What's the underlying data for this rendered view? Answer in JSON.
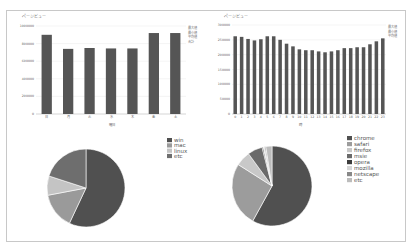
{
  "chart_data": [
    {
      "id": "weekday",
      "type": "bar",
      "title": "ページビュー",
      "xlabel": "曜日",
      "ylabel": "",
      "categories": [
        "日",
        "月",
        "火",
        "水",
        "木",
        "金",
        "土"
      ],
      "values": [
        900000,
        740000,
        750000,
        745000,
        745000,
        920000,
        920000
      ],
      "ylim": [
        0,
        1000000
      ],
      "yticks": [
        "0",
        "200000",
        "400000",
        "600000",
        "800000",
        "1000000"
      ],
      "ytick_values": [
        0,
        200000,
        400000,
        600000,
        800000,
        1000000
      ],
      "grid": true,
      "legend_lines": [
        "最大値",
        "最小値",
        "平均値",
        "合計"
      ],
      "legend_position": "right",
      "bar_color": "#555555"
    },
    {
      "id": "hourly",
      "type": "bar",
      "title": "ページビュー",
      "xlabel": "時",
      "ylabel": "",
      "categories": [
        "0",
        "1",
        "2",
        "3",
        "4",
        "5",
        "6",
        "7",
        "8",
        "9",
        "10",
        "11",
        "12",
        "13",
        "14",
        "15",
        "16",
        "17",
        "18",
        "19",
        "20",
        "21",
        "22",
        "23"
      ],
      "values": [
        262000,
        260000,
        253000,
        248000,
        252000,
        262000,
        262000,
        250000,
        237000,
        228000,
        218000,
        215000,
        215000,
        211000,
        208000,
        211000,
        215000,
        222000,
        222000,
        225000,
        225000,
        235000,
        245000,
        255000
      ],
      "ylim": [
        0,
        300000
      ],
      "yticks": [
        "0",
        "50000",
        "100000",
        "150000",
        "200000",
        "250000",
        "300000"
      ],
      "ytick_values": [
        0,
        50000,
        100000,
        150000,
        200000,
        250000,
        300000
      ],
      "grid": true,
      "legend_lines": [
        "最大値",
        "最小値",
        "平均値"
      ],
      "legend_position": "right",
      "bar_color": "#555555"
    },
    {
      "id": "os",
      "type": "pie",
      "title": "",
      "labels": [
        "win",
        "mac",
        "linux",
        "etc"
      ],
      "values": [
        57,
        15,
        8,
        20
      ],
      "colors": [
        "#505050",
        "#9a9a9a",
        "#c4c4c4",
        "#6e6e6e"
      ],
      "legend_position": "top-right"
    },
    {
      "id": "browser",
      "type": "pie",
      "title": "",
      "labels": [
        "chrome",
        "safari",
        "firefox",
        "msie",
        "opera",
        "mozilla",
        "netscape",
        "etc"
      ],
      "values": [
        58,
        26,
        6,
        6,
        0.5,
        0.5,
        0.5,
        2.5
      ],
      "colors": [
        "#505050",
        "#9c9c9c",
        "#c8c8c8",
        "#6a6a6a",
        "#3c3c3c",
        "#d6d6d6",
        "#888888",
        "#bcbcbc"
      ],
      "legend_position": "top-right"
    }
  ]
}
